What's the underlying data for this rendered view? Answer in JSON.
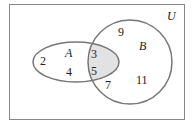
{
  "diagram": {
    "type": "venn",
    "universe_label": "U",
    "sets": [
      {
        "name": "A",
        "only": [
          "2",
          "4"
        ]
      },
      {
        "name": "B",
        "only": [
          "9",
          "7",
          "11"
        ]
      }
    ],
    "intersection": [
      "3",
      "5"
    ],
    "shaded_region": "A ∩ B",
    "colors": {
      "outline": "#777777",
      "shade": "#e2e2e2",
      "border": "#888888"
    }
  },
  "labels": {
    "U": "U",
    "A": "A",
    "B": "B",
    "n2": "2",
    "n4": "4",
    "n3": "3",
    "n5": "5",
    "n9": "9",
    "n7": "7",
    "n11": "11"
  }
}
